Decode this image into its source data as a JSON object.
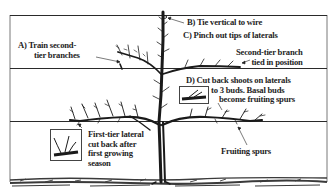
{
  "diagram": {
    "colors": {
      "ink": "#1e1e1e",
      "wire": "#2a2a2a",
      "background": "#ffffff",
      "ground": "#3a3a3a"
    },
    "wires": 3,
    "labels": {
      "a": {
        "line1": "A)  Train second-",
        "line2": "tier branches"
      },
      "b": {
        "text": "B)  Tie vertical to wire"
      },
      "c": {
        "text": "C)  Pinch out tips of laterals"
      },
      "second_tier": {
        "line1": "Second-tier branch",
        "line2": "tied in position"
      },
      "d": {
        "line1": "D)  Cut back shoots on laterals",
        "line2": "to 3 buds. Basal buds",
        "line3": "become  fruiting spurs"
      },
      "first_tier": {
        "line1": "First-tier lateral",
        "line2": "cut back after",
        "line3": "first growing",
        "line4": "season"
      },
      "fruiting": {
        "text": "Fruiting spurs"
      }
    },
    "icons": {
      "tree": "espalier-tree-icon",
      "inset_d": "pruned-lateral-detail-icon",
      "inset_first": "cut-lateral-detail-icon"
    }
  }
}
